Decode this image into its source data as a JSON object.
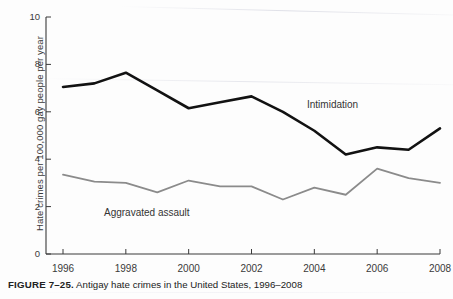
{
  "caption": {
    "label": "FIGURE 7–25.",
    "text": " Antigay hate crimes in the United States, 1996–2008"
  },
  "chart_data": {
    "type": "line",
    "title": "",
    "xlabel": "",
    "ylabel": "Hate crimes per 100,000 gay people per year",
    "xlim": [
      1996,
      2008
    ],
    "ylim": [
      0,
      10
    ],
    "grid": false,
    "legend": "inline-labels",
    "x": [
      1996,
      1997,
      1998,
      1999,
      2000,
      2001,
      2002,
      2003,
      2004,
      2005,
      2006,
      2007,
      2008
    ],
    "xticks": [
      1996,
      1998,
      2000,
      2002,
      2004,
      2006,
      2008
    ],
    "xtick_labels": [
      "1996",
      "1998",
      "2000",
      "2002",
      "2004",
      "2006",
      "2008"
    ],
    "yticks": [
      0,
      2,
      4,
      6,
      8,
      10
    ],
    "ytick_labels": [
      "0",
      "2",
      "4",
      "6",
      "8",
      "10"
    ],
    "series": [
      {
        "name": "Intimidation",
        "color": "#121212",
        "width": 2.6,
        "values": [
          7.05,
          7.2,
          7.65,
          6.9,
          6.15,
          6.4,
          6.65,
          6.0,
          5.2,
          4.2,
          4.5,
          4.4,
          5.3
        ]
      },
      {
        "name": "Aggravated assault",
        "color": "#8b8b8b",
        "width": 1.8,
        "values": [
          3.35,
          3.05,
          3.0,
          2.6,
          3.1,
          2.85,
          2.85,
          2.3,
          2.8,
          2.5,
          3.6,
          3.2,
          3.0
        ]
      }
    ]
  },
  "axis": {
    "line_color": "#3a3a3a"
  }
}
